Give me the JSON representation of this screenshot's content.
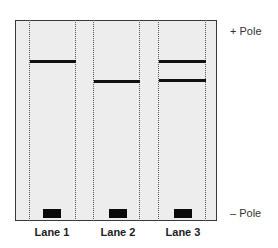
{
  "diagram": {
    "type": "gel-electrophoresis",
    "colors": {
      "gel_background": "#ededed",
      "gel_border": "#3a3a3a",
      "band": "#111111",
      "well": "#0a0a0a",
      "lane_divider": "#555555"
    },
    "poles": {
      "positive": "+ Pole",
      "negative": "– Pole"
    },
    "lanes": [
      {
        "label": "Lane 1",
        "bands": [
          {
            "y": 60
          }
        ]
      },
      {
        "label": "Lane 2",
        "bands": [
          {
            "y": 80
          }
        ]
      },
      {
        "label": "Lane 3",
        "bands": [
          {
            "y": 60
          },
          {
            "y": 79
          }
        ]
      }
    ]
  }
}
